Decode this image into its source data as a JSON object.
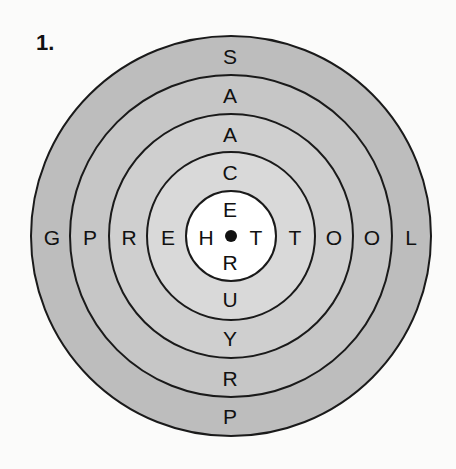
{
  "puzzle": {
    "number_label": "1.",
    "colors": {
      "ring_outer": "#bdbdbd",
      "ring_2": "#c6c6c6",
      "ring_3": "#cfcfcf",
      "ring_4": "#d9d9d9",
      "center": "#ffffff",
      "stroke": "#1a1a1a"
    },
    "horizontal_letters": [
      "G",
      "P",
      "R",
      "E",
      "H",
      "T",
      "T",
      "O",
      "O",
      "L"
    ],
    "vertical_letters": [
      "S",
      "A",
      "A",
      "C",
      "E",
      "R",
      "U",
      "Y",
      "R",
      "P"
    ],
    "letters": {
      "h0": "G",
      "h1": "P",
      "h2": "R",
      "h3": "E",
      "h4": "H",
      "h5": "T",
      "h6": "T",
      "h7": "O",
      "h8": "O",
      "h9": "L",
      "v0": "S",
      "v1": "A",
      "v2": "A",
      "v3": "C",
      "v4": "E",
      "v5": "R",
      "v6": "U",
      "v7": "Y",
      "v8": "R",
      "v9": "P"
    }
  }
}
